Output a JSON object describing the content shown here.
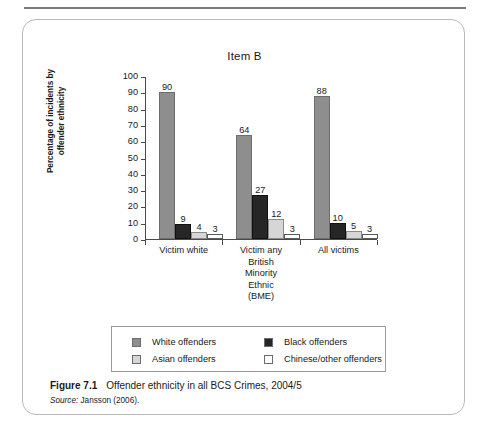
{
  "figure": {
    "title": "Item B",
    "caption_figure_number": "Figure 7.1",
    "caption_text": "Offender ethnicity in all BCS Crimes, 2004/5",
    "source_label": "Source:",
    "source_text": "Jansson (2006)."
  },
  "chart_data": {
    "type": "bar",
    "title": "Item B",
    "xlabel": "",
    "ylabel": "Percentage of incidents by offender ethnicity",
    "ylim": [
      0,
      100
    ],
    "ytick_labels": [
      "100",
      "90",
      "80",
      "70",
      "60",
      "50",
      "40",
      "30",
      "20",
      "10",
      "0"
    ],
    "ytick_values": [
      100,
      90,
      80,
      70,
      60,
      50,
      40,
      30,
      20,
      10,
      0
    ],
    "grid": false,
    "legend_position": "bottom",
    "categories": [
      "Victim white",
      "Victim any British Minority Ethnic (BME)",
      "All victims"
    ],
    "category_label_lines": [
      [
        "Victim white"
      ],
      [
        "Victim any",
        "British",
        "Minority",
        "Ethnic",
        "(BME)"
      ],
      [
        "All victims"
      ]
    ],
    "series": [
      {
        "name": "White offenders",
        "color": "#8e8e8e",
        "values": [
          90,
          64,
          88
        ]
      },
      {
        "name": "Black offenders",
        "color": "#262626",
        "values": [
          9,
          27,
          10
        ]
      },
      {
        "name": "Asian offenders",
        "color": "#d6d6d6",
        "values": [
          4,
          12,
          5
        ]
      },
      {
        "name": "Chinese/other offenders",
        "color": "#ffffff",
        "values": [
          3,
          3,
          3
        ]
      }
    ]
  },
  "legend": {
    "items": [
      {
        "label": "White offenders",
        "swatch": "swatch-white-off"
      },
      {
        "label": "Black offenders",
        "swatch": "swatch-black-off"
      },
      {
        "label": "Asian offenders",
        "swatch": "swatch-asian-off"
      },
      {
        "label": "Chinese/other offenders",
        "swatch": "swatch-chinese-off"
      }
    ]
  },
  "axis": {
    "y_title_line1": "Percentage of incidents by",
    "y_title_line2": "offender ethnicity"
  }
}
